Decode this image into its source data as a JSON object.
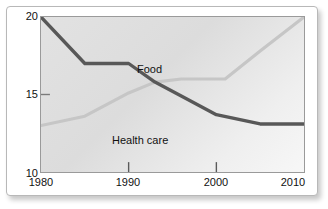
{
  "figure": {
    "partial_title_fragment": "",
    "background_color": "#ffffff",
    "plot_background": "#e2e2e2",
    "border_color": "#9a9a9a"
  },
  "chart_data": {
    "type": "line",
    "title": "",
    "subtitle": "",
    "xlabel": "",
    "ylabel": "",
    "xlim": [
      1980,
      2010
    ],
    "ylim": [
      10,
      20
    ],
    "xticks": [
      1980,
      1990,
      2000,
      2010
    ],
    "xtick_labels": [
      "1980",
      "1990",
      "2000",
      "2010"
    ],
    "yticks": [
      10,
      15,
      20
    ],
    "ytick_labels": [
      "10",
      "15",
      "20"
    ],
    "grid": false,
    "legend": "inline-annotations",
    "series": [
      {
        "name": "Food",
        "label": "Food",
        "color": "#595959",
        "line_width": 3,
        "x": [
          1980,
          1985,
          1990,
          1993,
          1996,
          2000,
          2005,
          2010
        ],
        "values": [
          20.0,
          17.0,
          17.0,
          15.8,
          14.9,
          13.7,
          13.1,
          13.1
        ]
      },
      {
        "name": "Health care",
        "label": "Health care",
        "color": "#c4c4c4",
        "line_width": 3,
        "x": [
          1980,
          1985,
          1990,
          1993,
          1996,
          2001,
          2005,
          2010
        ],
        "values": [
          13.0,
          13.6,
          15.1,
          15.8,
          16.0,
          16.0,
          17.8,
          20.0
        ]
      }
    ],
    "annotations": [
      {
        "text": "Food",
        "x": 1991,
        "y": 18.0
      },
      {
        "text": "Health care",
        "x": 1988,
        "y": 13.5
      }
    ]
  }
}
